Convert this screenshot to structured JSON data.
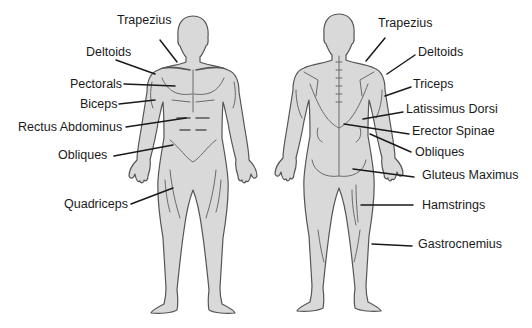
{
  "diagram": {
    "title": "",
    "front_view": {
      "labels": [
        {
          "text": "Trapezius",
          "x": 117,
          "y": 24,
          "anchor": "start",
          "line": [
            160,
            40,
            177,
            62
          ]
        },
        {
          "text": "Deltoids",
          "x": 86,
          "y": 56,
          "anchor": "start",
          "line": [
            116,
            60,
            155,
            74
          ]
        },
        {
          "text": "Pectorals",
          "x": 70,
          "y": 88,
          "anchor": "start",
          "line": [
            124,
            84,
            175,
            86
          ]
        },
        {
          "text": "Biceps",
          "x": 80,
          "y": 108,
          "anchor": "start",
          "line": [
            119,
            104,
            155,
            100
          ]
        },
        {
          "text": "Rectus Abdominus",
          "x": 18,
          "y": 131,
          "anchor": "start",
          "line": [
            126,
            127,
            186,
            118
          ]
        },
        {
          "text": "Obliques",
          "x": 58,
          "y": 159,
          "anchor": "start",
          "line": [
            114,
            156,
            173,
            145
          ]
        },
        {
          "text": "Quadriceps",
          "x": 64,
          "y": 208,
          "anchor": "start",
          "line": [
            131,
            204,
            173,
            188
          ]
        }
      ]
    },
    "back_view": {
      "labels": [
        {
          "text": "Trapezius",
          "x": 378,
          "y": 27,
          "anchor": "start",
          "line": [
            385,
            38,
            366,
            61
          ]
        },
        {
          "text": "Deltoids",
          "x": 418,
          "y": 56,
          "anchor": "start",
          "line": [
            415,
            55,
            387,
            74
          ]
        },
        {
          "text": "Triceps",
          "x": 413,
          "y": 88,
          "anchor": "start",
          "line": [
            411,
            87,
            385,
            96
          ]
        },
        {
          "text": "Latissimus Dorsi",
          "x": 406,
          "y": 113,
          "anchor": "start",
          "line": [
            403,
            112,
            363,
            119
          ]
        },
        {
          "text": "Erector Spinae",
          "x": 412,
          "y": 135,
          "anchor": "start",
          "line": [
            409,
            134,
            344,
            124
          ]
        },
        {
          "text": "Obliques",
          "x": 415,
          "y": 156,
          "anchor": "start",
          "line": [
            411,
            152,
            370,
            134
          ]
        },
        {
          "text": "Gluteus Maximus",
          "x": 422,
          "y": 179,
          "anchor": "start",
          "line": [
            414,
            177,
            353,
            169
          ]
        },
        {
          "text": "Hamstrings",
          "x": 422,
          "y": 209,
          "anchor": "start",
          "line": [
            413,
            205,
            361,
            205
          ]
        },
        {
          "text": "Gastrocnemius",
          "x": 418,
          "y": 248,
          "anchor": "start",
          "line": [
            412,
            246,
            372,
            244
          ]
        }
      ]
    },
    "colors": {
      "body_fill": "#d9d9d9",
      "outline": "#555555",
      "text": "#1a1a1a",
      "background": "#ffffff"
    }
  }
}
